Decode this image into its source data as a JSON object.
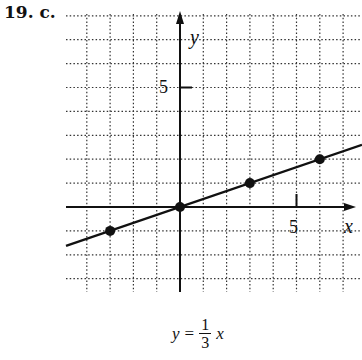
{
  "problem_label": "19. c.",
  "equation": {
    "lhs": "y",
    "equals": "=",
    "numerator": "1",
    "denominator": "3",
    "rhs_var": "x"
  },
  "axes": {
    "x_label": "x",
    "y_label": "y",
    "x_tick_label": "5",
    "y_tick_label": "5"
  },
  "colors": {
    "ink": "#111111",
    "grid": "#333333",
    "background": "#ffffff"
  },
  "chart_data": {
    "type": "line",
    "title": "",
    "equation": "y = 1/3 x",
    "xlabel": "x",
    "ylabel": "y",
    "xlim": [
      -4.9,
      7.8
    ],
    "ylim": [
      -3.6,
      8.2
    ],
    "grid": true,
    "grid_style": "dotted",
    "x_ticks_labeled": [
      5
    ],
    "y_ticks_labeled": [
      5
    ],
    "series": [
      {
        "name": "y = (1/3)x",
        "line": {
          "slope": 0.3333,
          "intercept": 0
        },
        "points": [
          {
            "x": -3,
            "y": -1
          },
          {
            "x": 0,
            "y": 0
          },
          {
            "x": 3,
            "y": 1
          },
          {
            "x": 6,
            "y": 2
          }
        ]
      }
    ],
    "legend": null
  }
}
